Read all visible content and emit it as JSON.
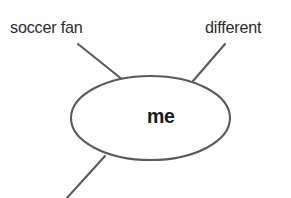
{
  "diagram": {
    "type": "mind-map",
    "title": "me",
    "center_node": {
      "label": "me",
      "shape": "ellipse",
      "cx": 150.5,
      "cy": 118,
      "rx": 79.5,
      "ry": 42
    },
    "branches": [
      {
        "id": "soccer-fan",
        "label": "soccer fan",
        "position": "top-left",
        "line": {
          "x1": 78,
          "y1": 44,
          "x2": 123,
          "y2": 80
        }
      },
      {
        "id": "different",
        "label": "different",
        "position": "top-right",
        "line": {
          "x1": 225,
          "y1": 44,
          "x2": 193,
          "y2": 81
        }
      },
      {
        "id": "unlabeled-bottom-left",
        "label": "",
        "position": "bottom-left",
        "line": {
          "x1": 105,
          "y1": 156,
          "x2": 67,
          "y2": 198
        }
      }
    ],
    "colors": {
      "background": "#ffffff",
      "stroke": "#5a5a5a",
      "label_text": "#2b2b2b",
      "center_text": "#1a1a1a"
    },
    "stroke_width": 2
  }
}
